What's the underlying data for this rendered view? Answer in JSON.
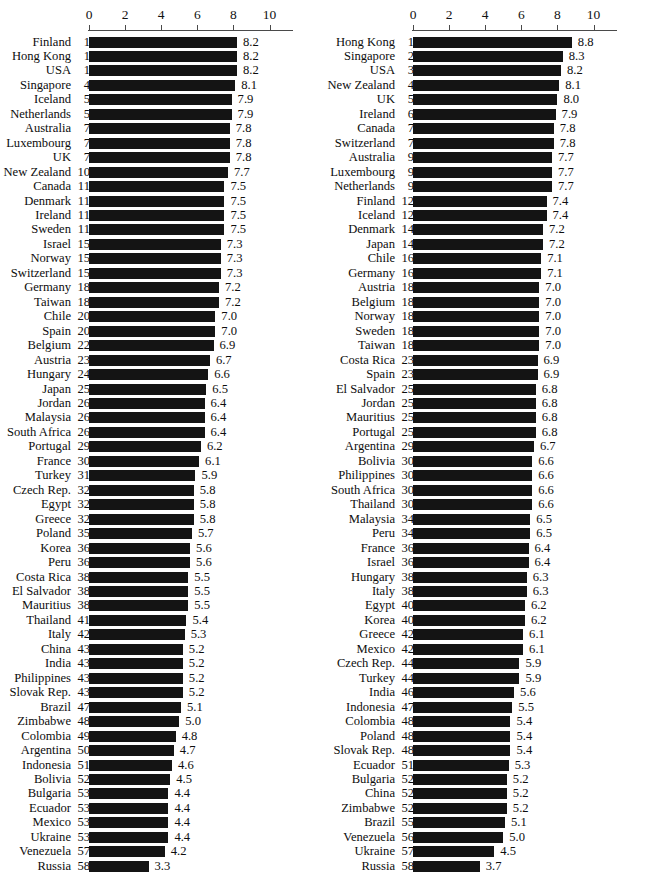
{
  "chart_data": [
    {
      "type": "bar",
      "title": "",
      "xlabel": "",
      "ylabel": "",
      "orientation": "horizontal",
      "xlim": [
        0,
        10
      ],
      "xticks": [
        0,
        2,
        4,
        6,
        8,
        10
      ],
      "grid": false,
      "legend": null,
      "columns": [
        "Country",
        "Rank",
        "Score"
      ],
      "categories": [
        "Finland",
        "Hong Kong",
        "USA",
        "Singapore",
        "Iceland",
        "Netherlands",
        "Australia",
        "Luxembourg",
        "UK",
        "New Zealand",
        "Canada",
        "Denmark",
        "Ireland",
        "Sweden",
        "Israel",
        "Norway",
        "Switzerland",
        "Germany",
        "Taiwan",
        "Chile",
        "Spain",
        "Belgium",
        "Austria",
        "Hungary",
        "Japan",
        "Jordan",
        "Malaysia",
        "South Africa",
        "Portugal",
        "France",
        "Turkey",
        "Czech Rep.",
        "Egypt",
        "Greece",
        "Poland",
        "Korea",
        "Peru",
        "Costa Rica",
        "El Salvador",
        "Mauritius",
        "Thailand",
        "Italy",
        "China",
        "India",
        "Philippines",
        "Slovak Rep.",
        "Brazil",
        "Zimbabwe",
        "Colombia",
        "Argentina",
        "Indonesia",
        "Bolivia",
        "Bulgaria",
        "Ecuador",
        "Mexico",
        "Ukraine",
        "Venezuela",
        "Russia"
      ],
      "ranks": [
        1,
        1,
        1,
        4,
        5,
        5,
        7,
        7,
        7,
        10,
        11,
        11,
        11,
        11,
        15,
        15,
        15,
        18,
        18,
        20,
        20,
        22,
        23,
        24,
        25,
        26,
        26,
        26,
        29,
        30,
        31,
        32,
        32,
        32,
        35,
        36,
        36,
        38,
        38,
        38,
        41,
        42,
        43,
        43,
        43,
        43,
        47,
        48,
        49,
        50,
        51,
        52,
        53,
        53,
        53,
        53,
        57,
        58
      ],
      "values": [
        8.2,
        8.2,
        8.2,
        8.1,
        7.9,
        7.9,
        7.8,
        7.8,
        7.8,
        7.7,
        7.5,
        7.5,
        7.5,
        7.5,
        7.3,
        7.3,
        7.3,
        7.2,
        7.2,
        7.0,
        7.0,
        6.9,
        6.7,
        6.6,
        6.5,
        6.4,
        6.4,
        6.4,
        6.2,
        6.1,
        5.9,
        5.8,
        5.8,
        5.8,
        5.7,
        5.6,
        5.6,
        5.5,
        5.5,
        5.5,
        5.4,
        5.3,
        5.2,
        5.2,
        5.2,
        5.2,
        5.1,
        5.0,
        4.8,
        4.7,
        4.6,
        4.5,
        4.4,
        4.4,
        4.4,
        4.4,
        4.2,
        3.3
      ],
      "value_labels": [
        "8.2",
        "8.2",
        "8.2",
        "8.1",
        "7.9",
        "7.9",
        "7.8",
        "7.8",
        "7.8",
        "7.7",
        "7.5",
        "7.5",
        "7.5",
        "7.5",
        "7.3",
        "7.3",
        "7.3",
        "7.2",
        "7.2",
        "7.0",
        "7.0",
        "6.9",
        "6.7",
        "6.6",
        "6.5",
        "6.4",
        "6.4",
        "6.4",
        "6.2",
        "6.1",
        "5.9",
        "5.8",
        "5.8",
        "5.8",
        "5.7",
        "5.6",
        "5.6",
        "5.5",
        "5.5",
        "5.5",
        "5.4",
        "5.3",
        "5.2",
        "5.2",
        "5.2",
        "5.2",
        "5.1",
        "5.0",
        "4.8",
        "4.7",
        "4.6",
        "4.5",
        "4.4",
        "4.4",
        "4.4",
        "4.4",
        "4.2",
        "3.3"
      ]
    },
    {
      "type": "bar",
      "title": "",
      "xlabel": "",
      "ylabel": "",
      "orientation": "horizontal",
      "xlim": [
        0,
        10
      ],
      "xticks": [
        0,
        2,
        4,
        6,
        8,
        10
      ],
      "grid": false,
      "legend": null,
      "columns": [
        "Country",
        "Rank",
        "Score"
      ],
      "categories": [
        "Hong Kong",
        "Singapore",
        "USA",
        "New Zealand",
        "UK",
        "Ireland",
        "Canada",
        "Switzerland",
        "Australia",
        "Luxembourg",
        "Netherlands",
        "Finland",
        "Iceland",
        "Denmark",
        "Japan",
        "Chile",
        "Germany",
        "Austria",
        "Belgium",
        "Norway",
        "Sweden",
        "Taiwan",
        "Costa Rica",
        "Spain",
        "El Salvador",
        "Jordan",
        "Mauritius",
        "Portugal",
        "Argentina",
        "Bolivia",
        "Philippines",
        "South Africa",
        "Thailand",
        "Malaysia",
        "Peru",
        "France",
        "Israel",
        "Hungary",
        "Italy",
        "Egypt",
        "Korea",
        "Greece",
        "Mexico",
        "Czech Rep.",
        "Turkey",
        "India",
        "Indonesia",
        "Colombia",
        "Poland",
        "Slovak Rep.",
        "Ecuador",
        "Bulgaria",
        "China",
        "Zimbabwe",
        "Brazil",
        "Venezuela",
        "Ukraine",
        "Russia"
      ],
      "ranks": [
        1,
        2,
        3,
        4,
        5,
        6,
        7,
        7,
        9,
        9,
        9,
        12,
        12,
        14,
        14,
        16,
        16,
        18,
        18,
        18,
        18,
        18,
        23,
        23,
        25,
        25,
        25,
        25,
        29,
        30,
        30,
        30,
        30,
        34,
        34,
        36,
        36,
        38,
        38,
        40,
        40,
        42,
        42,
        44,
        44,
        46,
        47,
        48,
        48,
        48,
        51,
        52,
        52,
        52,
        55,
        56,
        57,
        58
      ],
      "values": [
        8.8,
        8.3,
        8.2,
        8.1,
        8.0,
        7.9,
        7.8,
        7.8,
        7.7,
        7.7,
        7.7,
        7.4,
        7.4,
        7.2,
        7.2,
        7.1,
        7.1,
        7.0,
        7.0,
        7.0,
        7.0,
        7.0,
        6.9,
        6.9,
        6.8,
        6.8,
        6.8,
        6.8,
        6.7,
        6.6,
        6.6,
        6.6,
        6.6,
        6.5,
        6.5,
        6.4,
        6.4,
        6.3,
        6.3,
        6.2,
        6.2,
        6.1,
        6.1,
        5.9,
        5.9,
        5.6,
        5.5,
        5.4,
        5.4,
        5.4,
        5.3,
        5.2,
        5.2,
        5.2,
        5.1,
        5.0,
        4.5,
        3.7
      ],
      "value_labels": [
        "8.8",
        "8.3",
        "8.2",
        "8.1",
        "8.0",
        "7.9",
        "7.8",
        "7.8",
        "7.7",
        "7.7",
        "7.7",
        "7.4",
        "7.4",
        "7.2",
        "7.2",
        "7.1",
        "7.1",
        "7.0",
        "7.0",
        "7.0",
        "7.0",
        "7.0",
        "6.9",
        "6.9",
        "6.8",
        "6.8",
        "6.8",
        "6.8",
        "6.7",
        "6.6",
        "6.6",
        "6.6",
        "6.6",
        "6.5",
        "6.5",
        "6.4",
        "6.4",
        "6.3",
        "6.3",
        "6.2",
        "6.2",
        "6.1",
        "6.1",
        "5.9",
        "5.9",
        "5.6",
        "5.5",
        "5.4",
        "5.4",
        "5.4",
        "5.3",
        "5.2",
        "5.2",
        "5.2",
        "5.1",
        "5.0",
        "4.5",
        "3.7"
      ]
    }
  ],
  "layout": {
    "panels": [
      {
        "name": "left-chart",
        "origin_x": 89,
        "px_per_unit": 18.05,
        "name_right": 71,
        "rank_left": 74
      },
      {
        "name": "right-chart",
        "origin_x": 89,
        "px_per_unit": 18.05,
        "name_right": 71,
        "rank_left": 74
      }
    ],
    "row_height": 14.46,
    "bar_color": "#141414"
  }
}
